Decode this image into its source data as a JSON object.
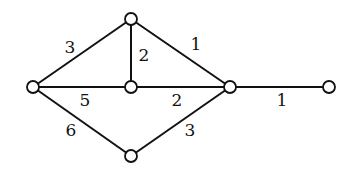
{
  "diagram": {
    "type": "weighted-graph",
    "nodes": [
      {
        "id": "top",
        "x": 131,
        "y": 19
      },
      {
        "id": "left",
        "x": 33,
        "y": 87
      },
      {
        "id": "middle",
        "x": 131,
        "y": 87
      },
      {
        "id": "right",
        "x": 230,
        "y": 87
      },
      {
        "id": "far-right",
        "x": 329,
        "y": 87
      },
      {
        "id": "bottom",
        "x": 131,
        "y": 156
      }
    ],
    "edges": [
      {
        "from": "left",
        "to": "top",
        "weight": "3",
        "label_x": 70,
        "label_y": 47
      },
      {
        "from": "top",
        "to": "middle",
        "weight": "2",
        "label_x": 144,
        "label_y": 55
      },
      {
        "from": "top",
        "to": "right",
        "weight": "1",
        "label_x": 196,
        "label_y": 44
      },
      {
        "from": "left",
        "to": "middle",
        "weight": "5",
        "label_x": 85,
        "label_y": 100
      },
      {
        "from": "middle",
        "to": "right",
        "weight": "2",
        "label_x": 177,
        "label_y": 100
      },
      {
        "from": "right",
        "to": "far-right",
        "weight": "1",
        "label_x": 282,
        "label_y": 100
      },
      {
        "from": "left",
        "to": "bottom",
        "weight": "6",
        "label_x": 71,
        "label_y": 130
      },
      {
        "from": "bottom",
        "to": "right",
        "weight": "3",
        "label_x": 190,
        "label_y": 130
      }
    ],
    "node_radius": 6,
    "colors": {
      "stroke": "#111111",
      "node_fill": "#ffffff",
      "background": "#ffffff"
    }
  }
}
